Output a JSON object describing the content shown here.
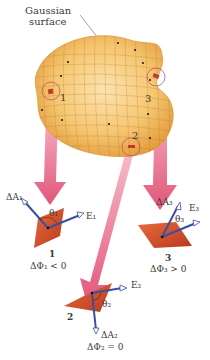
{
  "title": {
    "line1": "Gaussian",
    "line2": "surface"
  },
  "colors": {
    "surface_fill": "#f5c46a",
    "surface_edge": "#d99a3a",
    "grid": "#b07a30",
    "pink_arrow": "#e86a8a",
    "patch": "#d8532f",
    "vector_blue": "#3a4fa0",
    "callout_circle": "#c04070",
    "text": "#3a3a3a"
  },
  "surface_points": [
    {
      "id": "1",
      "label": "1"
    },
    {
      "id": "2",
      "label": "2"
    },
    {
      "id": "3",
      "label": "3"
    }
  ],
  "elements": [
    {
      "id": "1",
      "number": "1",
      "area_vector": "ΔA₁",
      "field_vector": "E₁",
      "angle": "θ₁",
      "flux": "ΔΦ₁ < 0"
    },
    {
      "id": "2",
      "number": "2",
      "area_vector": "ΔA₂",
      "field_vector": "E₂",
      "angle": "θ₂",
      "flux": "ΔΦ₂ = 0"
    },
    {
      "id": "3",
      "number": "3",
      "area_vector": "ΔA₃",
      "field_vector": "E₃",
      "angle": "θ₃",
      "flux": "ΔΦ₃ > 0"
    }
  ]
}
